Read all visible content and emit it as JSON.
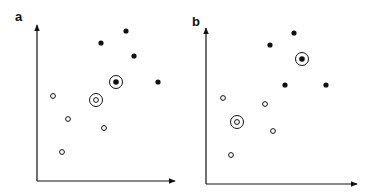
{
  "figure": {
    "panels": [
      {
        "label": "a",
        "filled_points": [
          [
            101,
            43
          ],
          [
            126,
            31
          ],
          [
            134,
            56
          ],
          [
            158,
            82
          ]
        ],
        "open_points": [
          [
            53,
            96
          ],
          [
            68,
            119
          ],
          [
            104,
            128
          ],
          [
            62,
            152
          ]
        ],
        "circled_filled": [
          116,
          82
        ],
        "circled_open": [
          96,
          100
        ],
        "axes": {
          "origin": [
            37,
            181
          ],
          "x_end": 175,
          "y_end": 25
        }
      },
      {
        "label": "b",
        "filled_points": [
          [
            270,
            45
          ],
          [
            294,
            33
          ],
          [
            285,
            85
          ],
          [
            326,
            85
          ]
        ],
        "open_points": [
          [
            223,
            98
          ],
          [
            265,
            104
          ],
          [
            273,
            131
          ],
          [
            231,
            155
          ]
        ],
        "circled_filled": [
          302,
          59
        ],
        "circled_open": [
          237,
          122
        ],
        "axes": {
          "origin": [
            206,
            184
          ],
          "x_end": 357,
          "y_end": 28
        }
      }
    ],
    "colors": {
      "ink": "#111111",
      "background": "#ffffff"
    }
  }
}
